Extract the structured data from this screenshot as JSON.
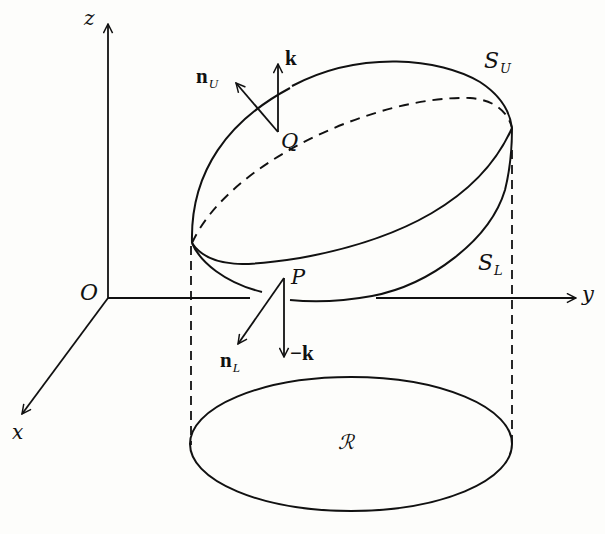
{
  "diagram": {
    "axes": {
      "z_label": "z",
      "x_label": "x",
      "y_label": "y",
      "origin_label": "O"
    },
    "surfaces": {
      "upper_label": "S",
      "upper_sub": "U",
      "lower_label": "S",
      "lower_sub": "L"
    },
    "points": {
      "upper_point": "Q",
      "lower_point": "P"
    },
    "vectors": {
      "upper_normal": "n",
      "upper_normal_sub": "U",
      "upper_k": "k",
      "lower_normal": "n",
      "lower_normal_sub": "L",
      "lower_k": "−k"
    },
    "region_label": "ℛ",
    "colors": {
      "ink": "#111111",
      "paper": "#fdfdfb"
    }
  }
}
